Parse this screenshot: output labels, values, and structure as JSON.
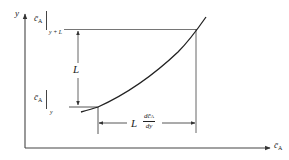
{
  "diagram": {
    "type": "concentration-profile-sketch",
    "axes": {
      "x_label": "c̄",
      "x_label_sub": "A",
      "y_label": "y"
    },
    "labels": {
      "top_value": "c̄",
      "top_value_sub": "A",
      "top_eval": "y + L",
      "bottom_value": "c̄",
      "bottom_value_sub": "A",
      "bottom_eval": "y",
      "vertical_dimension": "L",
      "horizontal_dimension_prefix": "L",
      "horizontal_dimension_num": "dc̄",
      "horizontal_dimension_num_sub": "A",
      "horizontal_dimension_den": "dy"
    },
    "colors": {
      "line": "#333333",
      "curve": "#222222",
      "background": "#ffffff"
    }
  }
}
